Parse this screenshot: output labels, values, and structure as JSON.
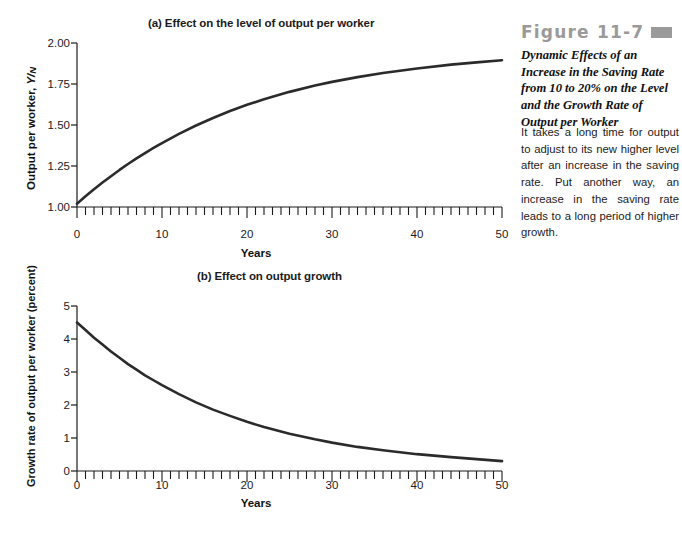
{
  "figure": {
    "head_label": "Figure 11-7",
    "subtitle": "Dynamic Effects of an Increase in the Saving Rate from 10 to 20% on the Level and the Growth Rate of Output per Worker",
    "body": "It takes a long time for output to adjust to its new higher level after an increase in the saving rate. Put another way, an increase in the saving rate leads to a long period of higher growth.",
    "head_color": "#9a9a9a",
    "curve_color": "#2b2b2b"
  },
  "chart_data": [
    {
      "id": "a",
      "type": "line",
      "title": "(a) Effect on the level of output per worker",
      "xlabel": "Years",
      "ylabel": "Output per worker, Y/N",
      "xlim": [
        0,
        50
      ],
      "ylim": [
        1.0,
        2.0
      ],
      "xticks": [
        0,
        10,
        20,
        30,
        40,
        50
      ],
      "xticklabels": [
        "0",
        "10",
        "20",
        "30",
        "40",
        "50"
      ],
      "minor_xtick_step": 1,
      "yticks": [
        1.0,
        1.25,
        1.5,
        1.75,
        2.0
      ],
      "yticklabels": [
        "1.00",
        "1.25",
        "1.50",
        "1.75",
        "2.00"
      ],
      "grid": false,
      "legend": "none",
      "x": [
        0,
        1,
        2,
        3,
        4,
        5,
        6,
        7,
        8,
        9,
        10,
        12,
        14,
        16,
        18,
        20,
        22,
        25,
        28,
        30,
        33,
        36,
        40,
        44,
        47,
        50
      ],
      "y": [
        1.02,
        1.065,
        1.108,
        1.149,
        1.188,
        1.226,
        1.262,
        1.296,
        1.329,
        1.36,
        1.39,
        1.446,
        1.497,
        1.543,
        1.585,
        1.623,
        1.657,
        1.702,
        1.741,
        1.763,
        1.792,
        1.817,
        1.845,
        1.868,
        1.882,
        1.895
      ]
    },
    {
      "id": "b",
      "type": "line",
      "title": "(b) Effect on output growth",
      "xlabel": "Years",
      "ylabel": "Growth rate of output per worker (percent)",
      "xlim": [
        0,
        50
      ],
      "ylim": [
        0,
        5
      ],
      "xticks": [
        0,
        10,
        20,
        30,
        40,
        50
      ],
      "xticklabels": [
        "0",
        "10",
        "20",
        "30",
        "40",
        "50"
      ],
      "minor_xtick_step": 1,
      "yticks": [
        0,
        1,
        2,
        3,
        4,
        5
      ],
      "yticklabels": [
        "0",
        "1",
        "2",
        "3",
        "4",
        "5"
      ],
      "grid": false,
      "legend": "none",
      "x": [
        0,
        1,
        2,
        3,
        4,
        5,
        6,
        7,
        8,
        9,
        10,
        12,
        14,
        16,
        18,
        20,
        22,
        25,
        28,
        30,
        33,
        36,
        40,
        44,
        47,
        50
      ],
      "y": [
        4.5,
        4.27,
        4.04,
        3.83,
        3.62,
        3.43,
        3.24,
        3.07,
        2.9,
        2.75,
        2.6,
        2.33,
        2.08,
        1.86,
        1.67,
        1.49,
        1.33,
        1.13,
        0.96,
        0.86,
        0.73,
        0.63,
        0.51,
        0.42,
        0.36,
        0.3
      ]
    }
  ]
}
